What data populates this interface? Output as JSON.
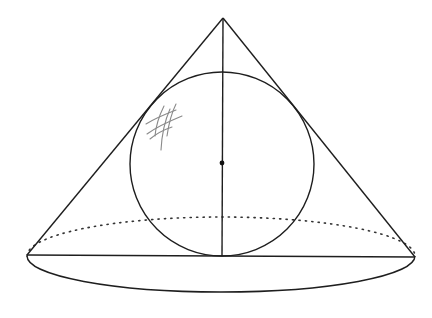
{
  "figure": {
    "title": "Cone with inscribed sphere",
    "colors": {
      "line": "#1e1e1e",
      "dotted": "#333333",
      "pencil": "#8a8a8a",
      "background": "#ffffff"
    },
    "geometry": {
      "apex": [
        223,
        18
      ],
      "base_left": [
        27,
        255
      ],
      "base_right": [
        415,
        257
      ],
      "base_ellipse": {
        "cx": 221,
        "cy": 256,
        "rx": 194,
        "ry": 37
      },
      "sphere": {
        "cx": 222,
        "cy": 164,
        "r": 92
      },
      "center_point": [
        222,
        163
      ],
      "axis": {
        "from": [
          223,
          18
        ],
        "to": [
          222,
          256
        ]
      }
    },
    "annotations": {
      "pencil_marks": "hand-drawn hatch scribble"
    }
  }
}
